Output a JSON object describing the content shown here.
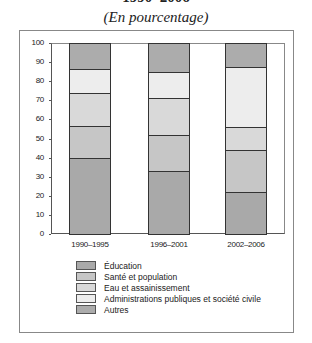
{
  "title": "1990–2006",
  "subtitle": "(En pourcentage)",
  "colors": {
    "Éducation": "#a9a9a9",
    "Santé et population": "#c6c6c6",
    "Eau et assainissement": "#d9d9d9",
    "Administrations publiques et société civile": "#ededed",
    "Autres": "#acacac"
  },
  "chart_data": {
    "type": "bar",
    "stacked": true,
    "title": "1990–2006",
    "subtitle": "(En pourcentage)",
    "xlabel": "",
    "ylabel": "",
    "ylim": [
      0,
      100
    ],
    "yticks": [
      0,
      10,
      20,
      30,
      40,
      50,
      60,
      70,
      80,
      90,
      100
    ],
    "grid": false,
    "legend_position": "bottom",
    "categories": [
      "1990–1995",
      "1996–2001",
      "2002–2006"
    ],
    "series": [
      {
        "name": "Éducation",
        "values": [
          40,
          33,
          22
        ]
      },
      {
        "name": "Santé et population",
        "values": [
          16.5,
          19,
          22
        ]
      },
      {
        "name": "Eau et assainissement",
        "values": [
          17.5,
          19,
          12
        ]
      },
      {
        "name": "Administrations publiques et société civile",
        "values": [
          12.5,
          14,
          31.5
        ]
      },
      {
        "name": "Autres",
        "values": [
          13.5,
          15,
          12.5
        ]
      }
    ]
  },
  "legend": [
    "Éducation",
    "Santé et population",
    "Eau et assainissement",
    "Administrations publiques et société civile",
    "Autres"
  ]
}
